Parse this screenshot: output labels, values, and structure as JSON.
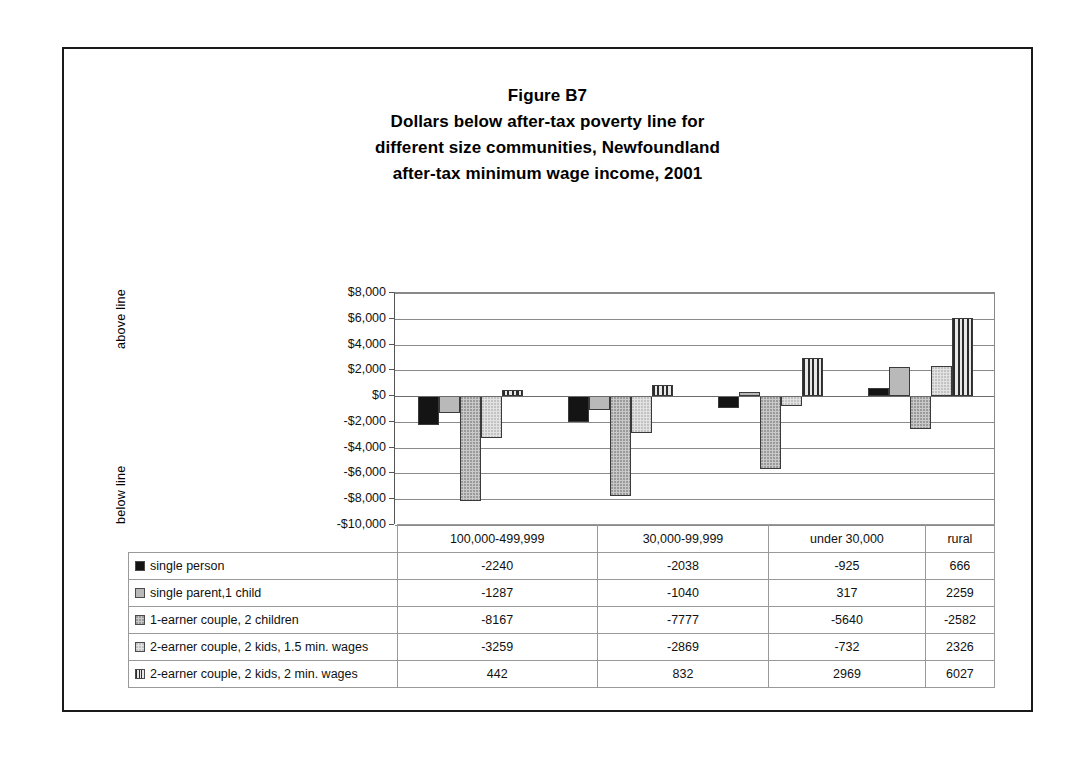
{
  "figure": {
    "title_lines": [
      "Figure B7",
      "Dollars below after-tax poverty line for",
      "different size communities, Newfoundland",
      "after-tax minimum wage income, 2001"
    ],
    "axis_caption_above": "above line",
    "axis_caption_below": "below line"
  },
  "chart_data": {
    "type": "bar",
    "xlabel": "",
    "ylabel": "",
    "ylim": [
      -10000,
      8000
    ],
    "ytick_labels": [
      "$8,000",
      "$6,000",
      "$4,000",
      "$2,000",
      "$0",
      "-$2,000",
      "-$4,000",
      "-$6,000",
      "-$8,000",
      "-$10,000"
    ],
    "ytick_values": [
      8000,
      6000,
      4000,
      2000,
      0,
      -2000,
      -4000,
      -6000,
      -8000,
      -10000
    ],
    "grid": true,
    "legend_position": "table-below",
    "categories": [
      "100,000-499,999",
      "30,000-99,999",
      "under 30,000",
      "rural"
    ],
    "series": [
      {
        "name": "single person",
        "pattern": "solid-black",
        "values": [
          -2240,
          -2038,
          -925,
          666
        ]
      },
      {
        "name": "single parent,1 child",
        "pattern": "gray",
        "values": [
          -1287,
          -1040,
          317,
          2259
        ]
      },
      {
        "name": "1-earner couple, 2 children",
        "pattern": "dotted-gray",
        "values": [
          -8167,
          -7777,
          -5640,
          -2582
        ]
      },
      {
        "name": "2-earner couple, 2 kids, 1.5 min. wages",
        "pattern": "light-dotted",
        "values": [
          -3259,
          -2869,
          -732,
          2326
        ]
      },
      {
        "name": "2-earner couple, 2 kids, 2 min. wages",
        "pattern": "vertical-stripe",
        "values": [
          442,
          832,
          2969,
          6027
        ]
      }
    ]
  },
  "table": {
    "corner_label": "",
    "column_headers": [
      "100,000-499,999",
      "30,000-99,999",
      "under 30,000",
      "rural"
    ],
    "rows": [
      {
        "label": "single person",
        "swatch": "solid-black",
        "cells": [
          "-2240",
          "-2038",
          "-925",
          "666"
        ]
      },
      {
        "label": "single parent,1 child",
        "swatch": "gray",
        "cells": [
          "-1287",
          "-1040",
          "317",
          "2259"
        ]
      },
      {
        "label": "1-earner couple, 2 children",
        "swatch": "dotted-gray",
        "cells": [
          "-8167",
          "-7777",
          "-5640",
          "-2582"
        ]
      },
      {
        "label": "2-earner couple, 2 kids, 1.5 min. wages",
        "swatch": "light-dotted",
        "cells": [
          "-3259",
          "-2869",
          "-732",
          "2326"
        ]
      },
      {
        "label": "2-earner couple, 2 kids, 2 min. wages",
        "swatch": "vertical-stripe",
        "cells": [
          "442",
          "832",
          "2969",
          "6027"
        ]
      }
    ]
  },
  "colors": {
    "series_solid": "#141414",
    "series_gray": "#b9b9b9",
    "series_dotted": "#c9c9c9",
    "series_light": "#e2e2e2",
    "series_stripe": "#2b2b2b",
    "grid": "#8a8a8a",
    "frame": "#1a1a1a"
  }
}
